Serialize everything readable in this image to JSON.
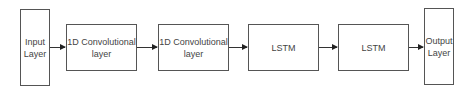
{
  "diagram": {
    "type": "flowchart",
    "direction": "left-to-right",
    "nodes": [
      {
        "id": "input",
        "label_line1": "Input",
        "label_line2": "Layer"
      },
      {
        "id": "conv1",
        "label_line1": "1D Convolutional",
        "label_line2": "layer"
      },
      {
        "id": "conv2",
        "label_line1": "1D Convolutional",
        "label_line2": "layer"
      },
      {
        "id": "lstm1",
        "label_line1": "LSTM",
        "label_line2": ""
      },
      {
        "id": "lstm2",
        "label_line1": "LSTM",
        "label_line2": ""
      },
      {
        "id": "output",
        "label_line1": "Output",
        "label_line2": "Layer"
      }
    ],
    "edges": [
      {
        "from": "input",
        "to": "conv1"
      },
      {
        "from": "conv1",
        "to": "conv2"
      },
      {
        "from": "conv2",
        "to": "lstm1"
      },
      {
        "from": "lstm1",
        "to": "lstm2"
      },
      {
        "from": "lstm2",
        "to": "output"
      }
    ],
    "colors": {
      "stroke": "#555555",
      "fill": "#ffffff",
      "text": "#444444"
    }
  }
}
